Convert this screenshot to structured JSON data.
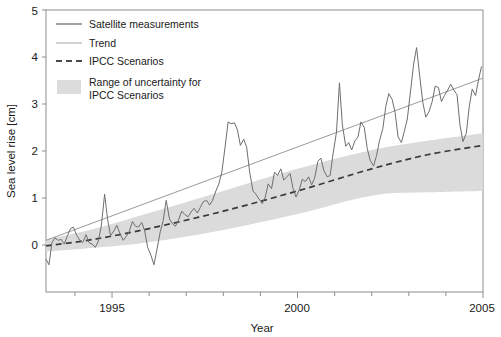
{
  "chart_data": {
    "type": "line",
    "title": "",
    "xlabel": "Year",
    "ylabel": "Sea level rise [cm]",
    "xlim": [
      1993.22,
      2005.0
    ],
    "ylim": [
      -1.0,
      5.0
    ],
    "xticks_major": [
      1995,
      2000,
      2005
    ],
    "xticks_major_labels": [
      "1995",
      "2000",
      "2005"
    ],
    "xticks_minor": [
      1994,
      1996,
      1997,
      1998,
      1999,
      2001,
      2002,
      2003,
      2004
    ],
    "yticks": [
      0,
      1,
      2,
      3,
      4,
      5
    ],
    "ytick_labels": [
      "0",
      "1",
      "2",
      "3",
      "4",
      "5"
    ],
    "grid": false,
    "legend_position": "top-left",
    "series": [
      {
        "name": "Satellite measurements",
        "style": "solid",
        "color": "#6e6e6e",
        "x": [
          1993.22,
          1993.3,
          1993.38,
          1993.46,
          1993.55,
          1993.63,
          1993.71,
          1993.8,
          1993.88,
          1993.96,
          1994.05,
          1994.13,
          1994.21,
          1994.3,
          1994.38,
          1994.46,
          1994.55,
          1994.63,
          1994.71,
          1994.8,
          1994.88,
          1994.96,
          1995.05,
          1995.13,
          1995.21,
          1995.3,
          1995.38,
          1995.46,
          1995.55,
          1995.63,
          1995.71,
          1995.8,
          1995.88,
          1995.96,
          1996.05,
          1996.13,
          1996.21,
          1996.3,
          1996.38,
          1996.46,
          1996.55,
          1996.63,
          1996.71,
          1996.8,
          1996.88,
          1996.96,
          1997.05,
          1997.13,
          1997.21,
          1997.3,
          1997.38,
          1997.46,
          1997.55,
          1997.63,
          1997.71,
          1997.8,
          1997.88,
          1997.96,
          1998.05,
          1998.13,
          1998.21,
          1998.3,
          1998.38,
          1998.46,
          1998.55,
          1998.63,
          1998.71,
          1998.8,
          1998.88,
          1998.96,
          1999.05,
          1999.13,
          1999.21,
          1999.3,
          1999.38,
          1999.46,
          1999.55,
          1999.63,
          1999.71,
          1999.8,
          1999.88,
          1999.96,
          2000.05,
          2000.13,
          2000.21,
          2000.3,
          2000.38,
          2000.46,
          2000.55,
          2000.63,
          2000.71,
          2000.8,
          2000.88,
          2000.96,
          2001.05,
          2001.13,
          2001.21,
          2001.3,
          2001.38,
          2001.46,
          2001.55,
          2001.63,
          2001.71,
          2001.8,
          2001.88,
          2001.96,
          2002.05,
          2002.13,
          2002.21,
          2002.3,
          2002.38,
          2002.46,
          2002.55,
          2002.63,
          2002.71,
          2002.8,
          2002.88,
          2002.96,
          2003.05,
          2003.13,
          2003.21,
          2003.3,
          2003.38,
          2003.46,
          2003.55,
          2003.63,
          2003.71,
          2003.8,
          2003.88,
          2003.96,
          2004.05,
          2004.13,
          2004.21,
          2004.3,
          2004.38,
          2004.46,
          2004.55,
          2004.63,
          2004.71,
          2004.8,
          2004.88,
          2004.96
        ],
        "y": [
          -0.3,
          -0.42,
          0.05,
          0.15,
          0.1,
          0.12,
          0.02,
          0.2,
          0.35,
          0.38,
          0.2,
          0.1,
          0.05,
          0.22,
          0.05,
          0.02,
          -0.05,
          0.08,
          0.4,
          1.08,
          0.55,
          0.2,
          0.3,
          0.42,
          0.25,
          0.1,
          0.18,
          0.28,
          0.5,
          0.4,
          0.38,
          0.48,
          0.3,
          -0.05,
          -0.22,
          -0.42,
          -0.1,
          0.28,
          0.52,
          0.95,
          0.55,
          0.45,
          0.4,
          0.55,
          0.72,
          0.65,
          0.6,
          0.7,
          0.78,
          0.68,
          0.8,
          0.92,
          0.95,
          0.85,
          0.95,
          1.15,
          1.3,
          1.55,
          2.1,
          2.62,
          2.58,
          2.6,
          2.45,
          2.12,
          2.25,
          2.08,
          1.55,
          1.15,
          1.08,
          0.98,
          0.88,
          1.02,
          1.3,
          1.2,
          1.55,
          1.48,
          1.62,
          1.38,
          1.45,
          1.52,
          1.2,
          1.02,
          1.18,
          1.4,
          1.35,
          1.45,
          1.28,
          1.42,
          1.78,
          1.85,
          1.58,
          1.45,
          1.48,
          1.95,
          2.4,
          3.45,
          2.55,
          2.1,
          2.18,
          2.02,
          2.22,
          2.3,
          2.62,
          2.5,
          2.05,
          1.8,
          1.68,
          1.9,
          2.22,
          2.48,
          2.95,
          3.22,
          3.1,
          2.82,
          2.3,
          2.18,
          2.42,
          2.68,
          3.3,
          3.85,
          4.2,
          3.55,
          3.02,
          2.72,
          2.85,
          3.05,
          3.38,
          3.35,
          3.05,
          3.18,
          3.3,
          3.42,
          3.3,
          3.2,
          2.55,
          2.2,
          2.38,
          2.95,
          3.32,
          3.18,
          3.52,
          3.8
        ]
      },
      {
        "name": "Trend",
        "style": "solid-thin",
        "color": "#9a9a9a",
        "x": [
          1993.22,
          2005.0
        ],
        "y": [
          0.1,
          3.55
        ]
      },
      {
        "name": "IPCC Scenarios",
        "style": "dashed",
        "color": "#3a3a3a",
        "x": [
          1993.22,
          1994.5,
          1996.0,
          1998.0,
          2000.0,
          2002.0,
          2003.5,
          2005.0
        ],
        "y": [
          -0.02,
          0.12,
          0.35,
          0.72,
          1.15,
          1.62,
          1.92,
          2.12
        ]
      }
    ],
    "band": {
      "name": "Range of uncertainty for IPCC Scenarios",
      "color": "#d9d9d9",
      "x": [
        1993.22,
        1994.5,
        1996.0,
        1998.0,
        2000.0,
        2002.0,
        2003.5,
        2005.0
      ],
      "upper": [
        0.12,
        0.34,
        0.68,
        1.15,
        1.62,
        2.02,
        2.22,
        2.38
      ],
      "lower": [
        -0.14,
        -0.06,
        0.06,
        0.32,
        0.66,
        1.05,
        1.12,
        1.15
      ]
    },
    "annotations": []
  },
  "legend": {
    "items": [
      {
        "label": "Satellite measurements",
        "swatch": "line-dark",
        "color": "#6e6e6e"
      },
      {
        "label": "Trend",
        "swatch": "line-light",
        "color": "#9a9a9a"
      },
      {
        "label": "IPCC Scenarios",
        "swatch": "line-dashed",
        "color": "#3a3a3a"
      },
      {
        "label": "Range of uncertainty for",
        "label2": "IPCC Scenarios",
        "swatch": "patch",
        "color": "#d9d9d9"
      }
    ]
  },
  "axes": {
    "ylabel": "Sea level rise [cm]",
    "xlabel": "Year",
    "ytick_0": "0",
    "ytick_1": "1",
    "ytick_2": "2",
    "ytick_3": "3",
    "ytick_4": "4",
    "ytick_5": "5",
    "xtick_1995": "1995",
    "xtick_2000": "2000",
    "xtick_2005": "2005"
  },
  "colors": {
    "frame": "#8d8d8d",
    "data": "#6e6e6e",
    "trend": "#9a9a9a",
    "scenario": "#3a3a3a",
    "band": "#d9d9d9",
    "text": "#1a1a1a",
    "background": "#ffffff"
  }
}
